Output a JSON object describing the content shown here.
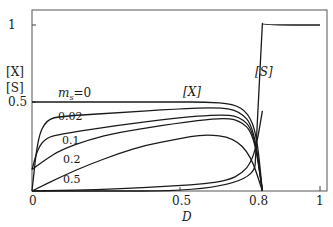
{
  "chart_data": {
    "type": "line",
    "title": "",
    "xlabel": "D",
    "ylabel": [
      "[X]",
      "[S]"
    ],
    "xlim": [
      0,
      1
    ],
    "ylim": [
      0,
      1
    ],
    "x_ticks": [
      "0",
      "0.5",
      "0.8",
      "1"
    ],
    "y_ticks": [
      "0.5",
      "1"
    ],
    "grid": false,
    "legend": "inline labels",
    "annotations": [
      "m_s=0",
      "0.02",
      "0.1",
      "0.2",
      "0.5",
      "[X]",
      "[S]"
    ],
    "series": [
      {
        "name": "[X], m_s=0",
        "x": [
          0,
          0.1,
          0.3,
          0.5,
          0.6,
          0.7,
          0.75,
          0.78,
          0.8
        ],
        "y": [
          0.5,
          0.5,
          0.5,
          0.5,
          0.5,
          0.49,
          0.44,
          0.32,
          0
        ]
      },
      {
        "name": "[X], m_s=0.02",
        "x": [
          0,
          0.02,
          0.05,
          0.1,
          0.3,
          0.5,
          0.65,
          0.72,
          0.77,
          0.8
        ],
        "y": [
          0,
          0.3,
          0.4,
          0.42,
          0.44,
          0.46,
          0.47,
          0.45,
          0.36,
          0
        ]
      },
      {
        "name": "[X], m_s=0.1",
        "x": [
          0,
          0.02,
          0.05,
          0.1,
          0.3,
          0.5,
          0.65,
          0.72,
          0.77,
          0.8
        ],
        "y": [
          0.12,
          0.24,
          0.3,
          0.32,
          0.37,
          0.41,
          0.43,
          0.42,
          0.34,
          0
        ]
      },
      {
        "name": "[X], m_s=0.2",
        "x": [
          0,
          0.05,
          0.1,
          0.2,
          0.3,
          0.5,
          0.65,
          0.72,
          0.77,
          0.8
        ],
        "y": [
          0.12,
          0.18,
          0.23,
          0.29,
          0.33,
          0.38,
          0.41,
          0.4,
          0.32,
          0
        ]
      },
      {
        "name": "[X], m_s=0.5",
        "x": [
          0,
          0.1,
          0.2,
          0.3,
          0.4,
          0.5,
          0.6,
          0.7,
          0.76,
          0.8
        ],
        "y": [
          0,
          0.08,
          0.15,
          0.21,
          0.26,
          0.29,
          0.32,
          0.3,
          0.2,
          0
        ]
      },
      {
        "name": "[S], m_s=0.5",
        "x": [
          0,
          0.3,
          0.5,
          0.6,
          0.68,
          0.73,
          0.76,
          0.78,
          0.8
        ],
        "y": [
          0,
          0.01,
          0.03,
          0.04,
          0.06,
          0.1,
          0.16,
          0.26,
          0.45
        ]
      },
      {
        "name": "[S]",
        "x": [
          0,
          0.77,
          0.78,
          0.8,
          0.8,
          1
        ],
        "y": [
          0,
          0,
          0.3,
          0.95,
          1,
          1
        ]
      }
    ]
  },
  "labels": {
    "y_axis_x": "[X]",
    "y_axis_s": "[S]",
    "x_axis": "D",
    "tick_x_0": "0",
    "tick_x_05": "0.5",
    "tick_x_08": "0.8",
    "tick_x_1": "1",
    "tick_y_05": "0.5",
    "tick_y_1": "1",
    "curve_ms0_prefix": "m",
    "curve_ms0_sub": "s",
    "curve_ms0_suffix": "=0",
    "curve_002": "0.02",
    "curve_01": "0.1",
    "curve_02": "0.2",
    "curve_05": "0.5",
    "curve_x": "[X]",
    "curve_s": "[S]"
  }
}
